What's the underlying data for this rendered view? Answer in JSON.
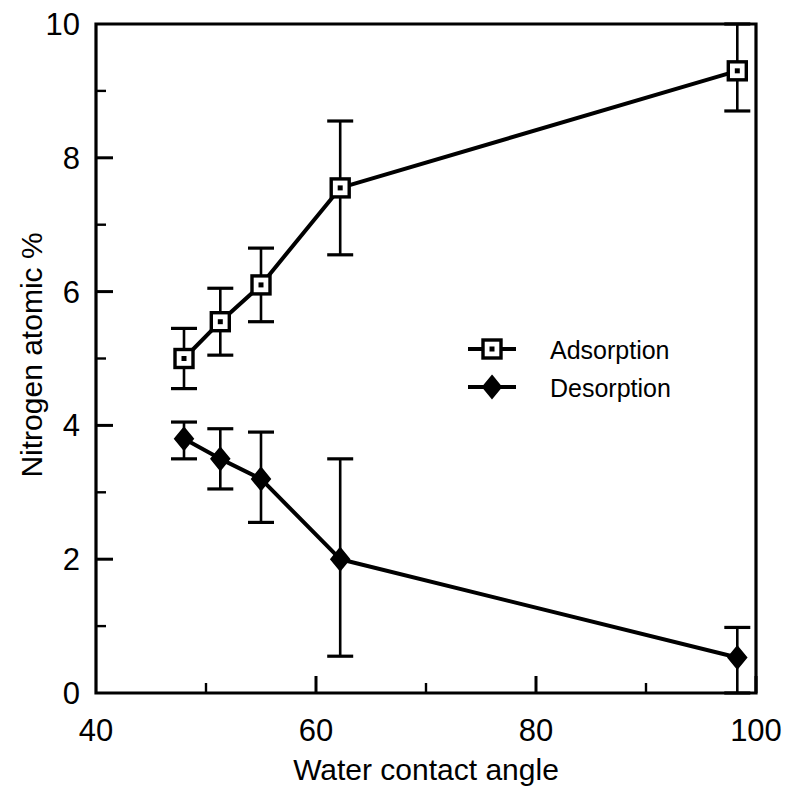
{
  "chart_data": {
    "type": "line",
    "title": "",
    "xlabel": "Water contact angle",
    "ylabel": "Nitrogen atomic %",
    "xlim": [
      40,
      100
    ],
    "ylim": [
      0,
      10
    ],
    "xticks": [
      40,
      60,
      80,
      100
    ],
    "xtick_labels": [
      "40",
      "60",
      "80",
      "100"
    ],
    "xminorticks": [
      50,
      70,
      90
    ],
    "yticks": [
      0,
      2,
      4,
      6,
      8,
      10
    ],
    "ytick_labels": [
      "0",
      "2",
      "4",
      "6",
      "8",
      "10"
    ],
    "yminorticks": [
      1,
      3,
      5,
      7,
      9
    ],
    "grid": false,
    "legend_position": "center-right",
    "errorbars": true,
    "series": [
      {
        "name": "Adsorption",
        "marker": "open-square",
        "x": [
          48.0,
          51.3,
          55.0,
          62.2,
          98.3
        ],
        "values": [
          5.0,
          5.55,
          6.1,
          7.55,
          9.3
        ],
        "yerr_low": [
          0.45,
          0.5,
          0.55,
          1.0,
          0.6
        ],
        "yerr_high": [
          0.45,
          0.5,
          0.55,
          1.0,
          0.7
        ]
      },
      {
        "name": "Desorption",
        "marker": "filled-diamond",
        "x": [
          48.0,
          51.3,
          55.0,
          62.2,
          98.3
        ],
        "values": [
          3.8,
          3.5,
          3.2,
          2.0,
          0.53
        ],
        "yerr_low": [
          0.3,
          0.45,
          0.65,
          1.45,
          0.53
        ],
        "yerr_high": [
          0.25,
          0.45,
          0.7,
          1.5,
          0.45
        ]
      }
    ]
  },
  "legend": {
    "entries": [
      {
        "label": "Adsorption",
        "marker": "open-square"
      },
      {
        "label": "Desorption",
        "marker": "filled-diamond"
      }
    ]
  },
  "axes": {
    "x_title": "Water contact angle",
    "y_title": "Nitrogen atomic %",
    "x_labels": [
      "40",
      "60",
      "80",
      "100"
    ],
    "y_labels": [
      "0",
      "2",
      "4",
      "6",
      "8",
      "10"
    ]
  },
  "colors": {
    "ink": "#000000",
    "background": "#ffffff",
    "marker_fill": "#ffffff"
  }
}
